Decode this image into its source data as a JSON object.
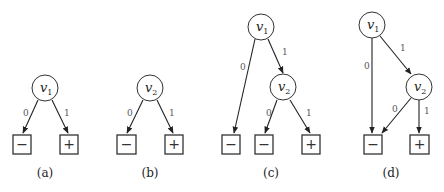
{
  "figure": {
    "panels": [
      {
        "caption": "(a)",
        "nodes": [
          {
            "id": "v1",
            "label": "v",
            "sub": "1"
          }
        ],
        "leaves": [
          {
            "label": "−"
          },
          {
            "label": "+"
          }
        ],
        "edges": [
          {
            "from": "v1",
            "to": "minus",
            "label": "0"
          },
          {
            "from": "v1",
            "to": "plus",
            "label": "1"
          }
        ]
      },
      {
        "caption": "(b)",
        "nodes": [
          {
            "id": "v2",
            "label": "v",
            "sub": "2"
          }
        ],
        "leaves": [
          {
            "label": "−"
          },
          {
            "label": "+"
          }
        ],
        "edges": [
          {
            "from": "v2",
            "to": "minus",
            "label": "0"
          },
          {
            "from": "v2",
            "to": "plus",
            "label": "1"
          }
        ]
      },
      {
        "caption": "(c)",
        "nodes": [
          {
            "id": "v1",
            "label": "v",
            "sub": "1"
          },
          {
            "id": "v2",
            "label": "v",
            "sub": "2"
          }
        ],
        "leaves": [
          {
            "label": "−"
          },
          {
            "label": "−"
          },
          {
            "label": "+"
          }
        ],
        "edges": [
          {
            "from": "v1",
            "to": "minus1",
            "label": "0"
          },
          {
            "from": "v1",
            "to": "v2",
            "label": "1"
          },
          {
            "from": "v2",
            "to": "minus2",
            "label": "0"
          },
          {
            "from": "v2",
            "to": "plus",
            "label": "1"
          }
        ]
      },
      {
        "caption": "(d)",
        "nodes": [
          {
            "id": "v1",
            "label": "v",
            "sub": "1"
          },
          {
            "id": "v2",
            "label": "v",
            "sub": "2"
          }
        ],
        "leaves": [
          {
            "label": "−"
          },
          {
            "label": "+"
          }
        ],
        "edges": [
          {
            "from": "v1",
            "to": "minus",
            "label": "0"
          },
          {
            "from": "v1",
            "to": "v2",
            "label": "1"
          },
          {
            "from": "v2",
            "to": "minus",
            "label": "0"
          },
          {
            "from": "v2",
            "to": "plus",
            "label": "1"
          }
        ]
      }
    ]
  }
}
